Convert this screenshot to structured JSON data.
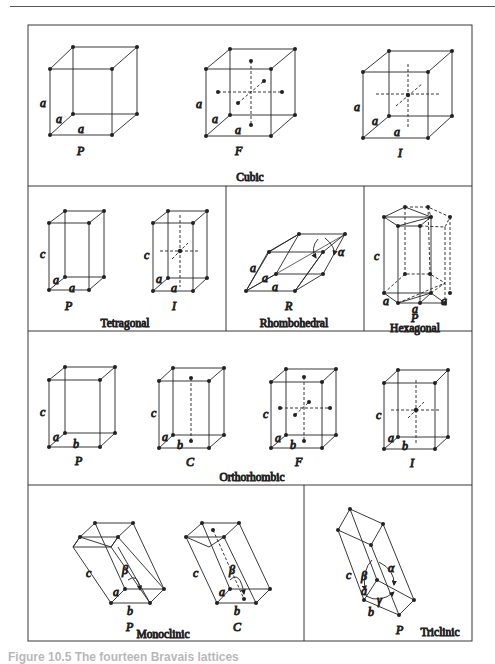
{
  "figure": {
    "caption_fragment": "Figure 10.5  The fourteen Bravais lattices",
    "systems": [
      {
        "name": "Cubic",
        "lattices": [
          "P",
          "F",
          "I"
        ],
        "edge_labels": [
          "a",
          "a",
          "a"
        ]
      },
      {
        "name": "Tetragonal",
        "lattices": [
          "P",
          "I"
        ],
        "edge_labels": [
          "c",
          "a",
          "a"
        ]
      },
      {
        "name": "Rhombohedral",
        "lattices": [
          "R"
        ],
        "edge_labels": [
          "a",
          "a",
          "a"
        ],
        "angle": "α"
      },
      {
        "name": "Hexagonal",
        "lattices": [
          "P"
        ],
        "edge_labels": [
          "c",
          "a",
          "a",
          "a"
        ]
      },
      {
        "name": "Orthorhombic",
        "lattices": [
          "P",
          "C",
          "F",
          "I"
        ],
        "edge_labels": [
          "c",
          "a",
          "b"
        ]
      },
      {
        "name": "Monoclinic",
        "lattices": [
          "P",
          "C"
        ],
        "edge_labels": [
          "c",
          "a",
          "b"
        ],
        "angle": "β"
      },
      {
        "name": "Triclinic",
        "lattices": [
          "P"
        ],
        "edge_labels": [
          "c",
          "a",
          "b"
        ],
        "angles": [
          "α",
          "β",
          "γ"
        ]
      }
    ]
  }
}
